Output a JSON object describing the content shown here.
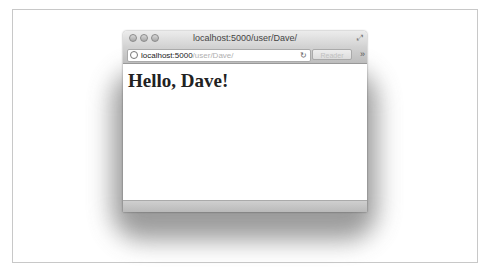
{
  "window": {
    "title": "localhost:5000/user/Dave/",
    "traffic_lights": [
      "close-button",
      "minimize-button",
      "zoom-button"
    ],
    "fullscreen_icon": "fullscreen-icon"
  },
  "toolbar": {
    "url_host": "localhost:5000",
    "url_path": "/user/Dave/",
    "reload_icon": "↻",
    "reader_label": "Reader",
    "more_icon": "»"
  },
  "content": {
    "heading": "Hello, Dave!"
  }
}
